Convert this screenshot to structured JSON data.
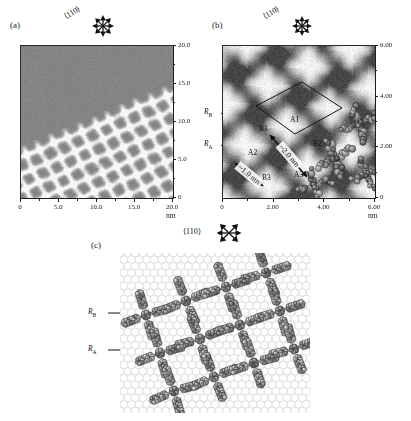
{
  "figure": {
    "caption_panels": [
      "(a)",
      "(b)",
      "(c)"
    ],
    "direction_label": "⟨110⟩",
    "direction_icon": "six-pointed-direction-star-icon"
  },
  "panel_a": {
    "letter": "(a)",
    "direction_label": "⟨110⟩",
    "unit": "nm",
    "x_ticks": [
      "0",
      "5.0",
      "10.0",
      "15.0",
      "20.0"
    ],
    "y_ticks": [
      "0",
      "5.0",
      "10.0",
      "15.0",
      "20.0"
    ],
    "x_range": [
      0,
      20
    ],
    "y_range": [
      0,
      20
    ],
    "description": "STM topograph of self-assembled molecular monolayer, 20 nm x 20 nm"
  },
  "panel_b": {
    "letter": "(b)",
    "direction_label": "⟨110⟩",
    "unit": "nm",
    "x_ticks": [
      "0",
      "2.00",
      "4.00",
      "6.00"
    ],
    "y_ticks": [
      "0",
      "2.00",
      "4.00",
      "6.00"
    ],
    "x_range": [
      0,
      6
    ],
    "y_range": [
      0,
      6
    ],
    "labels": {
      "a1": "A1",
      "a2": "A2",
      "a3": "A3",
      "b1": "B1",
      "b2": "B2",
      "b3": "B3",
      "r_a": "R",
      "r_a_sub": "A",
      "r_b": "R",
      "r_b_sub": "B"
    },
    "measurements": [
      {
        "name": "b1-a3-distance",
        "value": "~2.0 nm"
      },
      {
        "name": "a2-b3-distance",
        "value": "~1.0 nm"
      }
    ],
    "unit_cell": "parallelogram-overlay",
    "description": "High resolution STM image, 6 nm x 6 nm, with molecular model overlay"
  },
  "panel_c": {
    "letter": "(c)",
    "direction_label": "⟨110⟩",
    "labels": {
      "r_a": "R",
      "r_a_sub": "A",
      "r_b": "R",
      "r_b_sub": "B"
    },
    "description": "Space-filling structural model of the molecular assembly on hexagonal substrate lattice"
  },
  "chart_data": {
    "type": "heatmap",
    "title": "",
    "panels": [
      {
        "id": "a",
        "label": "(a)",
        "type": "stm-topograph",
        "xlabel": "nm",
        "ylabel": "nm",
        "xlim": [
          0,
          20
        ],
        "ylim": [
          0,
          20
        ],
        "xticks": [
          0,
          5,
          10,
          15,
          20
        ],
        "yticks": [
          0,
          5,
          10,
          15,
          20
        ],
        "xticklabels": [
          "0",
          "5.0",
          "10.0",
          "15.0",
          "20.0"
        ],
        "yticklabels": [
          "0",
          "5.0",
          "10.0",
          "15.0",
          "20.0"
        ],
        "lattice_period_nm": 2.0,
        "lattice_angle_deg": 30,
        "colormap": "grayscale",
        "annotations": [
          {
            "text": "⟨110⟩",
            "type": "direction-star"
          }
        ]
      },
      {
        "id": "b",
        "label": "(b)",
        "type": "stm-topograph",
        "xlabel": "nm",
        "ylabel": "nm",
        "xlim": [
          0,
          6
        ],
        "ylim": [
          0,
          6
        ],
        "xticks": [
          0,
          2,
          4,
          6
        ],
        "yticks": [
          0,
          2,
          4,
          6
        ],
        "xticklabels": [
          "0",
          "2.00",
          "4.00",
          "6.00"
        ],
        "yticklabels": [
          "0",
          "2.00",
          "4.00",
          "6.00"
        ],
        "colormap": "grayscale",
        "annotations": [
          {
            "text": "A1",
            "x": 2.9,
            "y": 2.75
          },
          {
            "text": "A2",
            "x": 1.15,
            "y": 1.15
          },
          {
            "text": "A3",
            "x": 3.0,
            "y": 0.65
          },
          {
            "text": "B1",
            "x": 1.75,
            "y": 2.5
          },
          {
            "text": "B2",
            "x": 3.85,
            "y": 1.95
          },
          {
            "text": "B3",
            "x": 1.75,
            "y": 0.45
          },
          {
            "text": "~2.0 nm",
            "type": "double-arrow",
            "from": "B1",
            "to": "A3"
          },
          {
            "text": "~1.0 nm",
            "type": "double-arrow",
            "from": "A2",
            "to": "B3"
          },
          {
            "text": "R_B",
            "type": "arrow-label",
            "x": 0.25,
            "y": 3.1
          },
          {
            "text": "R_A",
            "type": "arrow-label",
            "x": 0.25,
            "y": 2.1
          },
          {
            "text": "⟨110⟩",
            "type": "direction-star"
          },
          {
            "text": "unit cell",
            "type": "parallelogram"
          }
        ]
      },
      {
        "id": "c",
        "label": "(c)",
        "type": "structural-model",
        "annotations": [
          {
            "text": "R_B",
            "type": "arrow-label"
          },
          {
            "text": "R_A",
            "type": "arrow-label"
          },
          {
            "text": "⟨110⟩",
            "type": "direction-star"
          }
        ]
      }
    ]
  },
  "colors": {
    "panel_a_background": "#8a8a8a",
    "panel_a_highlight": "#e8e8e8",
    "panel_b_dark": "#6f6f6f",
    "panel_b_light": "#f2f2f2",
    "molecule_dark": "#6e6e6e",
    "molecule_mid": "#9a9a9a",
    "substrate_outline": "#d8d8d8",
    "axis": "#1d1d1d",
    "text": "#111111"
  }
}
